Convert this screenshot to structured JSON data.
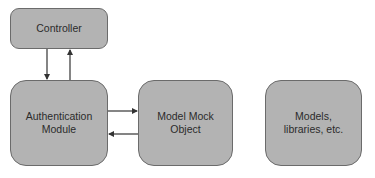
{
  "diagram": {
    "nodes": [
      {
        "id": "controller",
        "label": "Controller"
      },
      {
        "id": "auth",
        "label": "Authentication\nModule"
      },
      {
        "id": "mock",
        "label": "Model Mock\nObject"
      },
      {
        "id": "models",
        "label": "Models,\nlibraries, etc."
      }
    ],
    "edges": [
      {
        "from": "controller",
        "to": "auth"
      },
      {
        "from": "auth",
        "to": "controller"
      },
      {
        "from": "auth",
        "to": "mock"
      },
      {
        "from": "mock",
        "to": "auth"
      }
    ],
    "colors": {
      "node_fill": "#b3b3b3",
      "node_border": "#6b6b6b",
      "text": "#2b2b2b",
      "arrow": "#333333"
    }
  }
}
